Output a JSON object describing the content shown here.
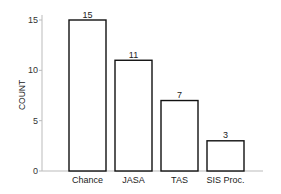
{
  "chart_data": {
    "type": "bar",
    "title": "",
    "xlabel": "",
    "ylabel": "COUNT",
    "categories": [
      "Chance",
      "JASA",
      "TAS",
      "SIS Proc."
    ],
    "values": [
      15,
      11,
      7,
      3
    ],
    "data_labels": [
      "15",
      "11",
      "7",
      "3"
    ],
    "yticks": [
      0,
      5,
      10,
      15
    ],
    "ylim": [
      0,
      15.5
    ],
    "grid": false,
    "legend": null,
    "bar_fill": "#ffffff",
    "bar_edge": "#111111"
  }
}
